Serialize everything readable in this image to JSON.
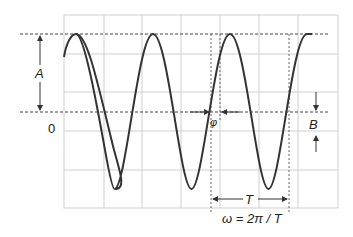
{
  "diagram": {
    "type": "sinusoid-parameters",
    "labels": {
      "amplitude": "A",
      "zero": "0",
      "phase": "φ",
      "offset": "B",
      "period": "T",
      "equation": "ω = 2π / T"
    },
    "colors": {
      "curve": "#333333",
      "grid": "#cccccc",
      "dashed": "#444444",
      "text": "#222222"
    },
    "grid": {
      "columns": 7,
      "rows": 5
    }
  }
}
